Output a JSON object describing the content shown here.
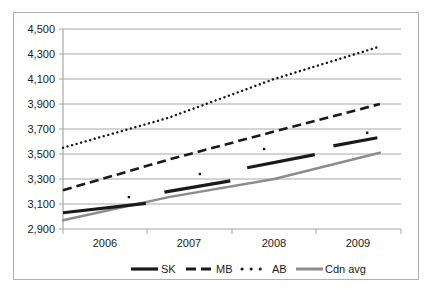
{
  "chart_data": {
    "type": "line",
    "title": "",
    "subtitle": "",
    "xlabel": "",
    "ylabel": "",
    "xlim": [
      2006,
      2010
    ],
    "ylim": [
      2900,
      4500
    ],
    "ytick_step": 200,
    "grid": "horizontal",
    "legend_position": "bottom",
    "categories": [
      "2006",
      "2007",
      "2008",
      "2009"
    ],
    "x_tick_labels": [
      "2006",
      "2007",
      "2008",
      "2009"
    ],
    "y_tick_labels": [
      "2,900",
      "3,100",
      "3,300",
      "3,500",
      "3,700",
      "3,900",
      "4,100",
      "4,300",
      "4,500"
    ],
    "y_tick_values": [
      2900,
      3100,
      3300,
      3500,
      3700,
      3900,
      4100,
      4300,
      4500
    ],
    "series": [
      {
        "name": "SK",
        "style": "solid-thick-black",
        "color": "#1a1a1a",
        "segments": [
          {
            "period": "2006",
            "x_start": 2006.0,
            "x_end": 2006.98,
            "y_start": 3030,
            "y_end": 3105
          },
          {
            "period": "2007",
            "x_start": 2007.2,
            "x_end": 2007.98,
            "y_start": 3195,
            "y_end": 3285
          },
          {
            "period": "2008",
            "x_start": 2008.18,
            "x_end": 2008.98,
            "y_start": 3390,
            "y_end": 3495
          },
          {
            "period": "2009",
            "x_start": 2009.2,
            "x_end": 2009.72,
            "y_start": 3565,
            "y_end": 3630
          }
        ]
      },
      {
        "name": "MB",
        "style": "dashed-black",
        "color": "#1a1a1a",
        "values": [
          3210,
          3455,
          3680,
          3900
        ],
        "x_start": 2006.0,
        "x_end": 2009.75
      },
      {
        "name": "AB",
        "style": "dotted-black",
        "color": "#1a1a1a",
        "values": [
          3550,
          3790,
          4100,
          4360
        ],
        "x_start": 2006.0,
        "x_end": 2009.75,
        "markers": [
          {
            "x": 2006.78,
            "y": 3155
          },
          {
            "x": 2007.62,
            "y": 3340
          },
          {
            "x": 2008.38,
            "y": 3540
          },
          {
            "x": 2009.6,
            "y": 3670
          }
        ]
      },
      {
        "name": "Cdn avg",
        "style": "solid-gray",
        "color": "#8c8c8c",
        "values": [
          2970,
          3155,
          3300,
          3510
        ],
        "x_start": 2006.0,
        "x_end": 2009.75
      }
    ],
    "legend": [
      {
        "label": "SK",
        "style": "solid-thick-black",
        "color": "#1a1a1a"
      },
      {
        "label": "MB",
        "style": "dashed-black",
        "color": "#1a1a1a"
      },
      {
        "label": "AB",
        "style": "dotted-black",
        "color": "#1a1a1a"
      },
      {
        "label": "Cdn avg",
        "style": "solid-gray",
        "color": "#8c8c8c"
      }
    ]
  },
  "colors": {
    "frame_border": "#b0b0b0",
    "gridline": "#a8a8a8",
    "axis": "#a8a8a8",
    "text": "#1a1a1a",
    "series_black": "#1a1a1a",
    "series_gray": "#8c8c8c",
    "background": "#ffffff"
  },
  "axis": {
    "y_labels": [
      "4,500",
      "4,300",
      "4,100",
      "3,900",
      "3,700",
      "3,500",
      "3,300",
      "3,100",
      "2,900"
    ],
    "x_labels": [
      "2006",
      "2007",
      "2008",
      "2009"
    ]
  }
}
